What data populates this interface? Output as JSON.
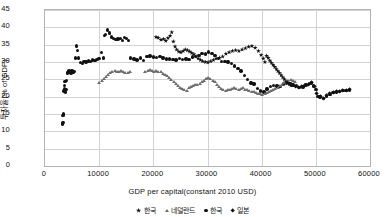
{
  "chart_data": {
    "type": "scatter",
    "title": "",
    "xlabel": "GDP per capital(constant 2010 USD)",
    "ylabel": "투자율(% of GDP)",
    "xlim": [
      0,
      60000
    ],
    "ylim": [
      0,
      45
    ],
    "xticks": [
      0,
      10000,
      20000,
      30000,
      40000,
      50000,
      60000
    ],
    "yticks": [
      0,
      5,
      10,
      15,
      20,
      25,
      30,
      35,
      40,
      45
    ],
    "xtick_labels": [
      "0",
      "10000",
      "20000",
      "30000",
      "40000",
      "50000",
      "60000"
    ],
    "ytick_labels": [
      "0",
      "5",
      "10",
      "15",
      "20",
      "25",
      "30",
      "35",
      "40",
      "45"
    ],
    "grid": true,
    "grid_axis": "both",
    "legend_position": "bottom",
    "series": [
      {
        "name": "한국",
        "marker": "circle",
        "color": "#111111",
        "points": [
          [
            3200,
            12.1
          ],
          [
            3300,
            12.6
          ],
          [
            3350,
            14.6
          ],
          [
            3400,
            15.0
          ],
          [
            3450,
            14.9
          ],
          [
            3500,
            21.6
          ],
          [
            3550,
            22.4
          ],
          [
            3600,
            23.2
          ],
          [
            3700,
            24.4
          ],
          [
            3800,
            21.3
          ],
          [
            3900,
            22.1
          ],
          [
            4000,
            24.7
          ],
          [
            4100,
            26.8
          ],
          [
            4200,
            26.9
          ],
          [
            4400,
            27.4
          ],
          [
            4600,
            27.0
          ],
          [
            4800,
            26.8
          ],
          [
            5000,
            27.6
          ],
          [
            5200,
            26.9
          ],
          [
            5400,
            27.2
          ],
          [
            5600,
            31.2
          ],
          [
            5800,
            34.6
          ],
          [
            6000,
            33.4
          ],
          [
            6200,
            31.1
          ],
          [
            6500,
            29.9
          ],
          [
            6900,
            29.6
          ],
          [
            7200,
            30.1
          ],
          [
            7600,
            30.0
          ],
          [
            8000,
            30.3
          ],
          [
            8400,
            30.2
          ],
          [
            8800,
            30.6
          ],
          [
            9200,
            30.5
          ],
          [
            9600,
            30.7
          ],
          [
            10000,
            31.0
          ],
          [
            10400,
            32.8
          ],
          [
            10800,
            31.1
          ],
          [
            11000,
            37.6
          ],
          [
            11200,
            37.9
          ],
          [
            11500,
            39.2
          ],
          [
            11900,
            38.4
          ],
          [
            12300,
            37.2
          ],
          [
            12700,
            36.8
          ],
          [
            13100,
            36.5
          ],
          [
            13500,
            36.6
          ],
          [
            13900,
            36.7
          ],
          [
            14300,
            36.2
          ],
          [
            14700,
            37.1
          ],
          [
            15100,
            36.8
          ],
          [
            15400,
            36.2
          ],
          [
            15800,
            31.2
          ],
          [
            16400,
            30.9
          ],
          [
            17000,
            30.6
          ],
          [
            17600,
            31.2
          ],
          [
            18200,
            30.4
          ],
          [
            18800,
            31.6
          ],
          [
            19400,
            31.7
          ],
          [
            20000,
            31.5
          ],
          [
            20600,
            31.3
          ],
          [
            21200,
            31.6
          ],
          [
            21800,
            31.2
          ],
          [
            22400,
            30.9
          ],
          [
            23000,
            30.9
          ],
          [
            23600,
            30.8
          ],
          [
            24200,
            30.6
          ],
          [
            24800,
            31.0
          ],
          [
            25400,
            30.7
          ],
          [
            26000,
            30.9
          ],
          [
            26600,
            30.8
          ],
          [
            27200,
            31.4
          ],
          [
            27800,
            31.6
          ],
          [
            28400,
            31.9
          ],
          [
            29000,
            32.4
          ],
          [
            29600,
            32.3
          ],
          [
            30200,
            32.9
          ],
          [
            30800,
            32.5
          ],
          [
            31400,
            31.9
          ],
          [
            32000,
            31.0
          ],
          [
            32600,
            30.2
          ],
          [
            33200,
            30.1
          ],
          [
            33800,
            30.0
          ],
          [
            34400,
            29.5
          ],
          [
            35000,
            28.9
          ],
          [
            35600,
            28.2
          ],
          [
            36200,
            27.4
          ],
          [
            36800,
            26.1
          ],
          [
            37400,
            24.9
          ],
          [
            38000,
            24.0
          ],
          [
            38600,
            23.6
          ],
          [
            39200,
            22.4
          ],
          [
            39800,
            21.6
          ],
          [
            40400,
            21.4
          ],
          [
            41000,
            22.2
          ],
          [
            41600,
            22.9
          ],
          [
            42200,
            23.3
          ],
          [
            42800,
            23.1
          ],
          [
            43400,
            23.0
          ],
          [
            44000,
            23.6
          ],
          [
            44600,
            24.0
          ],
          [
            45200,
            23.8
          ],
          [
            45800,
            23.4
          ],
          [
            46400,
            23.2
          ],
          [
            47000,
            22.6
          ],
          [
            47600,
            22.8
          ],
          [
            48200,
            23.4
          ],
          [
            48800,
            23.8
          ],
          [
            49200,
            24.0
          ],
          [
            49600,
            23.1
          ],
          [
            50000,
            22.0
          ],
          [
            50400,
            20.1
          ],
          [
            50800,
            19.9
          ],
          [
            51400,
            19.4
          ],
          [
            52000,
            20.2
          ],
          [
            52600,
            20.7
          ],
          [
            53200,
            21.2
          ],
          [
            53800,
            21.4
          ],
          [
            54400,
            21.5
          ],
          [
            55000,
            21.7
          ],
          [
            55600,
            21.8
          ],
          [
            56200,
            21.9
          ]
        ]
      },
      {
        "name": "네덜란드",
        "marker": "triangle",
        "color": "#6d6d6d",
        "points": [
          [
            10100,
            24.0
          ],
          [
            10500,
            24.6
          ],
          [
            10900,
            25.1
          ],
          [
            11300,
            25.6
          ],
          [
            11700,
            26.2
          ],
          [
            12100,
            26.8
          ],
          [
            12500,
            27.1
          ],
          [
            12900,
            27.3
          ],
          [
            13300,
            27.0
          ],
          [
            13700,
            27.2
          ],
          [
            14100,
            27.4
          ],
          [
            14500,
            27.1
          ],
          [
            14900,
            26.9
          ],
          [
            15300,
            26.8
          ],
          [
            15700,
            27.0
          ],
          [
            18600,
            27.2
          ],
          [
            19000,
            27.4
          ],
          [
            19400,
            27.6
          ],
          [
            19800,
            27.3
          ],
          [
            20200,
            27.1
          ],
          [
            20600,
            27.4
          ],
          [
            21000,
            27.2
          ],
          [
            21400,
            27.0
          ],
          [
            21800,
            26.6
          ],
          [
            22200,
            26.2
          ],
          [
            22600,
            25.8
          ],
          [
            23000,
            25.4
          ],
          [
            23400,
            24.8
          ],
          [
            23800,
            24.2
          ],
          [
            24200,
            23.6
          ],
          [
            24600,
            23.0
          ],
          [
            25000,
            22.6
          ],
          [
            25400,
            22.2
          ],
          [
            25800,
            21.8
          ],
          [
            26200,
            21.6
          ],
          [
            26600,
            22.4
          ],
          [
            27000,
            22.9
          ],
          [
            27400,
            23.1
          ],
          [
            27800,
            23.4
          ],
          [
            28200,
            23.2
          ],
          [
            28600,
            23.6
          ],
          [
            29000,
            24.1
          ],
          [
            29400,
            24.6
          ],
          [
            29800,
            25.0
          ],
          [
            30200,
            25.3
          ],
          [
            30600,
            25.0
          ],
          [
            31000,
            24.6
          ],
          [
            31400,
            24.1
          ],
          [
            31800,
            23.4
          ],
          [
            32200,
            22.8
          ],
          [
            32600,
            22.2
          ],
          [
            33000,
            21.9
          ],
          [
            33400,
            21.6
          ],
          [
            33800,
            21.8
          ],
          [
            34200,
            22.0
          ],
          [
            34600,
            22.2
          ],
          [
            35000,
            22.4
          ],
          [
            35400,
            22.1
          ],
          [
            35800,
            21.9
          ],
          [
            36200,
            22.2
          ],
          [
            36600,
            22.4
          ],
          [
            37000,
            22.0
          ],
          [
            37400,
            21.8
          ],
          [
            37800,
            21.6
          ],
          [
            38200,
            21.4
          ],
          [
            38600,
            21.2
          ],
          [
            39000,
            21.0
          ],
          [
            39400,
            20.8
          ],
          [
            39800,
            20.6
          ],
          [
            40200,
            20.4
          ],
          [
            40600,
            20.6
          ],
          [
            41000,
            21.0
          ],
          [
            41400,
            21.4
          ],
          [
            41800,
            21.6
          ],
          [
            42200,
            21.8
          ],
          [
            42600,
            22.2
          ],
          [
            43000,
            22.6
          ],
          [
            43400,
            23.0
          ],
          [
            43800,
            23.4
          ],
          [
            44200,
            23.9
          ],
          [
            44600,
            24.2
          ],
          [
            45000,
            24.6
          ],
          [
            45400,
            24.9
          ],
          [
            45800,
            24.6
          ],
          [
            46200,
            24.2
          ]
        ]
      },
      {
        "name": "일본",
        "marker": "star",
        "color": "#111111",
        "points": [
          [
            20500,
            37.2
          ],
          [
            20900,
            37.0
          ],
          [
            21400,
            36.4
          ],
          [
            21900,
            36.6
          ],
          [
            22300,
            36.1
          ],
          [
            22700,
            36.9
          ],
          [
            23100,
            37.6
          ],
          [
            23400,
            38.6
          ],
          [
            23700,
            35.9
          ],
          [
            24000,
            34.5
          ],
          [
            24300,
            33.6
          ],
          [
            24700,
            33.0
          ],
          [
            25100,
            32.8
          ],
          [
            25500,
            33.2
          ],
          [
            25900,
            33.6
          ],
          [
            26300,
            33.4
          ],
          [
            26700,
            33.0
          ],
          [
            27100,
            32.6
          ],
          [
            27500,
            32.2
          ],
          [
            27900,
            31.6
          ],
          [
            28300,
            31.0
          ],
          [
            28700,
            30.6
          ],
          [
            29100,
            30.2
          ],
          [
            29600,
            30.0
          ],
          [
            30100,
            29.9
          ],
          [
            30600,
            30.2
          ],
          [
            31100,
            30.6
          ],
          [
            31600,
            31.0
          ],
          [
            32200,
            31.2
          ],
          [
            32800,
            31.6
          ],
          [
            33400,
            32.4
          ],
          [
            34000,
            32.8
          ],
          [
            34600,
            33.2
          ],
          [
            35200,
            33.4
          ],
          [
            35800,
            33.2
          ],
          [
            36400,
            33.6
          ],
          [
            37000,
            34.0
          ],
          [
            37600,
            34.4
          ],
          [
            38200,
            34.6
          ],
          [
            38800,
            34.1
          ],
          [
            39400,
            33.2
          ],
          [
            39900,
            32.0
          ],
          [
            40300,
            31.0
          ],
          [
            40600,
            30.0
          ],
          [
            40900,
            31.8
          ],
          [
            41200,
            31.2
          ],
          [
            41500,
            30.4
          ],
          [
            41800,
            29.8
          ],
          [
            42100,
            29.2
          ],
          [
            42400,
            28.6
          ],
          [
            42700,
            28.0
          ],
          [
            43000,
            27.4
          ],
          [
            43300,
            26.8
          ],
          [
            43600,
            26.2
          ],
          [
            43900,
            25.6
          ],
          [
            44200,
            25.0
          ],
          [
            44500,
            24.4
          ],
          [
            44800,
            24.0
          ],
          [
            45100,
            23.6
          ],
          [
            45400,
            23.2
          ]
        ]
      },
      {
        "name": "미국",
        "marker": "diamond",
        "color": "#111111",
        "points": [
          [
            45600,
            23.4
          ],
          [
            46200,
            23.0
          ],
          [
            46800,
            22.6
          ],
          [
            47400,
            22.8
          ],
          [
            48000,
            23.2
          ],
          [
            48600,
            23.6
          ],
          [
            49200,
            24.0
          ],
          [
            49800,
            23.0
          ],
          [
            50200,
            21.0
          ],
          [
            50800,
            19.9
          ],
          [
            51400,
            19.5
          ],
          [
            52000,
            20.4
          ],
          [
            52600,
            20.9
          ],
          [
            53200,
            21.3
          ],
          [
            53800,
            21.5
          ],
          [
            54400,
            21.6
          ],
          [
            55000,
            21.7
          ],
          [
            55600,
            21.8
          ],
          [
            56200,
            21.9
          ]
        ]
      }
    ]
  },
  "axis": {
    "x_title": "GDP per capital(constant 2010 USD)",
    "y_title": "투자율(% of GDP)"
  },
  "legend": {
    "items": [
      {
        "label": "한국",
        "marker": "star-icon"
      },
      {
        "label": "네덜란드",
        "marker": "triangle-icon"
      },
      {
        "label": "한국",
        "marker": "circle-icon"
      },
      {
        "label": "일본",
        "marker": "diamond-icon"
      }
    ]
  }
}
